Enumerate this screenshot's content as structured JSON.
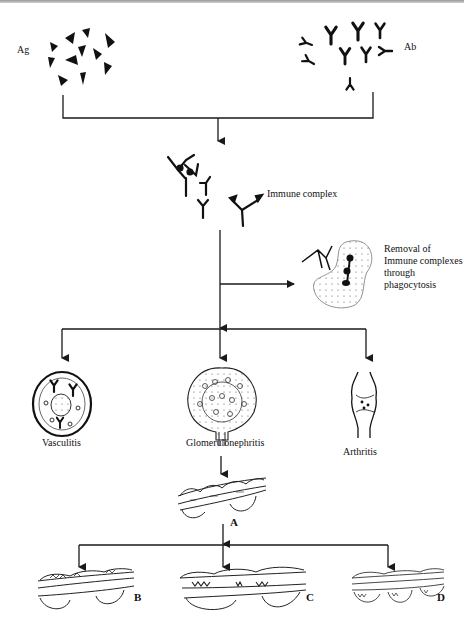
{
  "diagram": {
    "labels": {
      "antigen": "Ag",
      "antibody": "Ab",
      "immune_complex": "Immune complex",
      "removal": "Removal of Immune complexes through phagocytosis",
      "vasculitis": "Vasculitis",
      "glomerulonephritis": "Glomerulonephritis",
      "arthritis": "Arthritis",
      "stage_a": "A",
      "stage_b": "B",
      "stage_c": "C",
      "stage_d": "D"
    },
    "flow": [
      {
        "from": "Ag",
        "to": "Immune complex"
      },
      {
        "from": "Ab",
        "to": "Immune complex"
      },
      {
        "from": "Immune complex",
        "to": "Removal of Immune complexes through phagocytosis"
      },
      {
        "from": "Immune complex",
        "to": "Vasculitis"
      },
      {
        "from": "Immune complex",
        "to": "Glomerulonephritis"
      },
      {
        "from": "Immune complex",
        "to": "Arthritis"
      },
      {
        "from": "Glomerulonephritis",
        "to": "A"
      },
      {
        "from": "A",
        "to": "B"
      },
      {
        "from": "A",
        "to": "C"
      },
      {
        "from": "A",
        "to": "D"
      }
    ],
    "colors": {
      "line": "#1a1a1a",
      "background": "#ffffff"
    }
  }
}
